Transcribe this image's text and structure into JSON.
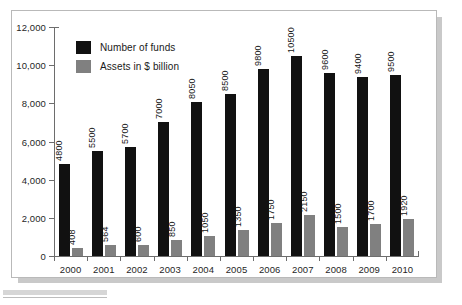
{
  "chart_data": {
    "type": "bar",
    "title": "",
    "subtitle": "",
    "xlabel": "",
    "ylabel": "",
    "categories": [
      "2000",
      "2001",
      "2002",
      "2003",
      "2004",
      "2005",
      "2006",
      "2007",
      "2008",
      "2009",
      "2010"
    ],
    "series": [
      {
        "name": "Number of funds",
        "color": "#111111",
        "values": [
          4800,
          5500,
          5700,
          7000,
          8050,
          8500,
          9800,
          10500,
          9600,
          9400,
          9500
        ],
        "labels": [
          "4800",
          "5500",
          "5700",
          "7000",
          "8050",
          "8500",
          "9800",
          "10500",
          "9600",
          "9400",
          "9500"
        ]
      },
      {
        "name": "Assets in $ billion",
        "color": "#808080",
        "values": [
          408,
          564,
          600,
          850,
          1050,
          1350,
          1750,
          2150,
          1500,
          1700,
          1920
        ],
        "labels": [
          "408",
          "564",
          "600",
          "850",
          "1050",
          "1350",
          "1750",
          "2150",
          "1500",
          "1700",
          "1920"
        ]
      }
    ],
    "ylim": [
      0,
      12000
    ],
    "yticks": [
      0,
      2000,
      4000,
      6000,
      8000,
      10000,
      12000
    ],
    "ytick_labels": [
      "0",
      "2,000",
      "4,000",
      "6,000",
      "8,000",
      "10,000",
      "12,000"
    ],
    "grid": false,
    "legend_position": "top-left",
    "legend": [
      {
        "label": "Number of funds",
        "color": "#111111"
      },
      {
        "label": "Assets in $ billion",
        "color": "#808080"
      }
    ]
  }
}
